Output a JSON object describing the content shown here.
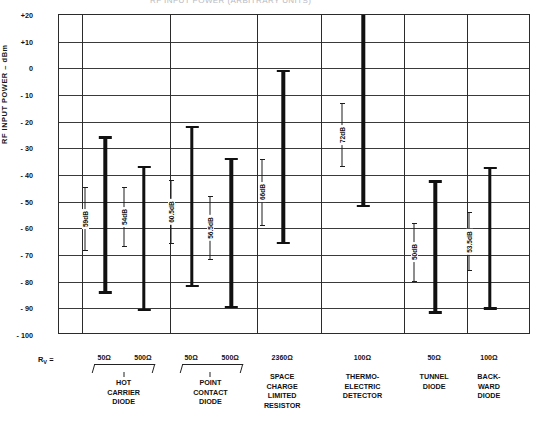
{
  "figure": {
    "cut_title": "RF INPUT POWER (ARBITRARY UNITS)"
  },
  "chart_data": {
    "type": "bar",
    "title": "",
    "xlabel": "",
    "ylabel": "RF INPUT POWER – dBm",
    "ylim": [
      -100,
      20
    ],
    "ytick_labels": [
      "+20",
      "+10",
      "0",
      "- 10",
      "- 20",
      "- 30",
      "- 40",
      "- 50",
      "- 60",
      "- 70",
      "- 80",
      "- 90",
      "- 100"
    ],
    "yticks": [
      20,
      10,
      0,
      -10,
      -20,
      -30,
      -40,
      -50,
      -60,
      -70,
      -80,
      -90,
      -100
    ],
    "grid": true,
    "legend": null,
    "orientation": "vertical-range-bars",
    "note": "Each bar is a dynamic-range span; annotation gives the span in dB",
    "bars": [
      {
        "device": "HOT CARRIER DIODE",
        "rv": "50Ω",
        "top": -25.5,
        "bottom": -84.5,
        "span_label": "59dB",
        "span": 59.0
      },
      {
        "device": "HOT CARRIER DIODE",
        "rv": "500Ω",
        "top": -36.5,
        "bottom": -91.0,
        "span_label": "54dB",
        "span": 54.0
      },
      {
        "device": "POINT CONTACT DIODE",
        "rv": "50Ω",
        "top": -21.5,
        "bottom": -82.0,
        "span_label": "60.5dB",
        "span": 60.5
      },
      {
        "device": "POINT CONTACT DIODE",
        "rv": "500Ω",
        "top": -33.5,
        "bottom": -90.0,
        "span_label": "56.5dB",
        "span": 56.5
      },
      {
        "device": "SPACE CHARGE LIMITED RESISTOR",
        "rv": "2360Ω",
        "top": -0.5,
        "bottom": -66.0,
        "span_label": "66dB",
        "span": 66.0
      },
      {
        "device": "THERMO-ELECTRIC DETECTOR",
        "rv": "100Ω",
        "top": 20.0,
        "bottom": -52.0,
        "span_label": "72dB",
        "span": 72.0
      },
      {
        "device": "TUNNEL DIODE",
        "rv": "50Ω",
        "top": -42.0,
        "bottom": -92.0,
        "span_label": "50dB",
        "span": 50.0
      },
      {
        "device": "BACKWARD DIODE",
        "rv": "100Ω",
        "top": -37.0,
        "bottom": -90.5,
        "span_label": "53.5dB",
        "span": 53.5
      }
    ]
  },
  "axis_bottom": {
    "rv_prefix": "R",
    "rv_sub": "V",
    "rv_eq": " =",
    "groups": [
      {
        "name_lines": [
          "HOT",
          "CARRIER",
          "DIODE"
        ],
        "rv_values": [
          "50Ω",
          "500Ω"
        ],
        "brace": true
      },
      {
        "name_lines": [
          "POINT",
          "CONTACT",
          "DIODE"
        ],
        "rv_values": [
          "50Ω",
          "500Ω"
        ],
        "brace": true
      },
      {
        "name_lines": [
          "SPACE",
          "CHARGE",
          "LIMITED",
          "RESISTOR"
        ],
        "rv_values": [
          "2360Ω"
        ],
        "brace": false
      },
      {
        "name_lines": [
          "THERMO-",
          "ELECTRIC",
          "DETECTOR"
        ],
        "rv_values": [
          "100Ω"
        ],
        "brace": false
      },
      {
        "name_lines": [
          "TUNNEL",
          "DIODE"
        ],
        "rv_values": [
          "50Ω"
        ],
        "brace": false
      },
      {
        "name_lines": [
          "BACK-",
          "WARD",
          "DIODE"
        ],
        "rv_values": [
          "100Ω"
        ],
        "brace": false
      }
    ]
  },
  "colors": {
    "bar": "#111111",
    "grid": "#3a3a3a",
    "axis": "#2b2b2b",
    "text": "#111111",
    "background": "#ffffff"
  }
}
